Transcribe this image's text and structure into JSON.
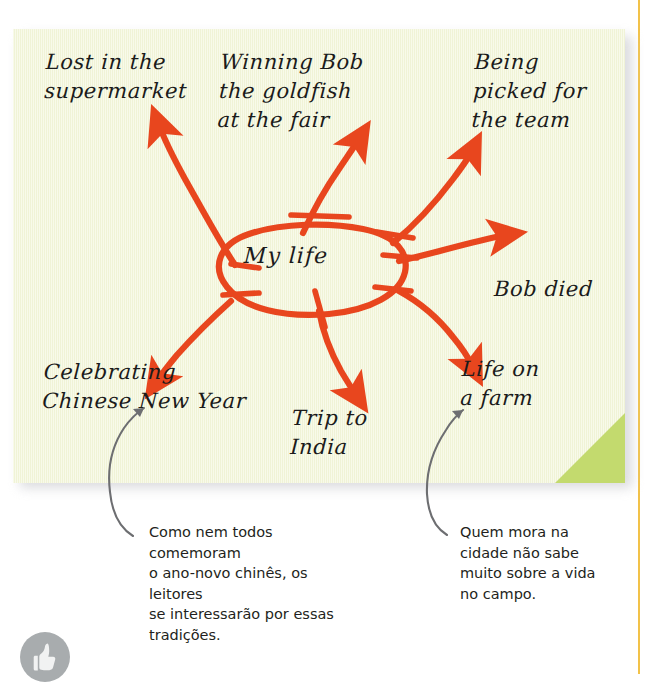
{
  "theme": {
    "note_bg": "#f3f6d9",
    "note_corner": "#c3da6e",
    "branch_color": "#e8461e",
    "callout_color": "#6d6e71",
    "rule_color": "#f2c249",
    "ink_color": "#1b1b1b",
    "badge_color": "#a8acae"
  },
  "mindmap": {
    "center": {
      "label": "My life"
    },
    "branches": [
      {
        "id": "supermarket",
        "label": "Lost in the\nsupermarket",
        "position": "top-left"
      },
      {
        "id": "goldfish",
        "label": "Winning Bob\nthe goldfish\nat the fair",
        "position": "top-center"
      },
      {
        "id": "team",
        "label": "Being\npicked for\nthe team",
        "position": "top-right"
      },
      {
        "id": "bob-died",
        "label": "Bob died",
        "position": "right"
      },
      {
        "id": "farm",
        "label": "Life on\na farm",
        "position": "bottom-right"
      },
      {
        "id": "india",
        "label": "Trip to\nIndia",
        "position": "bottom-center"
      },
      {
        "id": "chinese-new-year",
        "label": "Celebrating\nChinese New Year",
        "position": "bottom-left"
      }
    ]
  },
  "annotations": [
    {
      "id": "chinese-new-year-note",
      "text": "Como nem todos comemoram\no ano-novo chinês, os leitores\nse interessarão por essas\ntradições.",
      "points_to": "chinese-new-year"
    },
    {
      "id": "farm-note",
      "text": "Quem mora na\ncidade não sabe\nmuito sobre a vida\nno campo.",
      "points_to": "farm"
    }
  ],
  "badge": {
    "icon": "thumbs-up-icon"
  }
}
